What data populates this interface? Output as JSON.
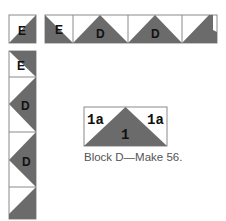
{
  "colors": {
    "dark": "#6b6b6b",
    "light": "#ffffff",
    "stroke": "#8a8a8a",
    "label": "#111111",
    "caption": "#555555"
  },
  "corner_block": {
    "label": "E"
  },
  "top_border": {
    "cells": [
      {
        "label": "E"
      },
      {
        "label": "D"
      },
      {
        "label": "D"
      },
      {
        "label": ""
      }
    ]
  },
  "left_border": {
    "cells": [
      {
        "label": "E"
      },
      {
        "label": "D"
      },
      {
        "label": "D"
      },
      {
        "label": ""
      }
    ]
  },
  "block_d": {
    "left_patch": "1a",
    "center_patch": "1",
    "right_patch": "1a",
    "caption": "Block D—Make 56."
  }
}
